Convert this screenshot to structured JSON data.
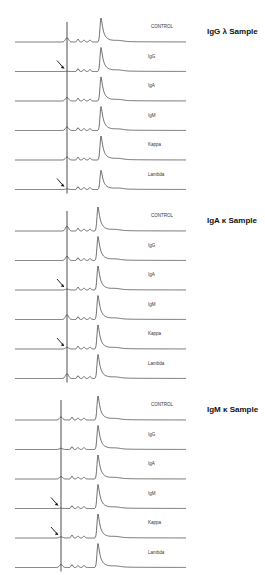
{
  "chart_data": {
    "type": "line",
    "panels": [
      {
        "title": "IgG λ  Sample",
        "arrow_rows": [
          "IgG",
          "Lambda"
        ],
        "traces": [
          {
            "label": "CONTROL",
            "first_peak": 0.35,
            "main_peak": 1.0
          },
          {
            "label": "IgG",
            "first_peak": 0.02,
            "main_peak": 1.0
          },
          {
            "label": "IgA",
            "first_peak": 0.3,
            "main_peak": 1.0
          },
          {
            "label": "IgM",
            "first_peak": 0.3,
            "main_peak": 1.0
          },
          {
            "label": "Kappa",
            "first_peak": 0.25,
            "main_peak": 1.0
          },
          {
            "label": "Lambda",
            "first_peak": 0.05,
            "main_peak": 0.8
          }
        ]
      },
      {
        "title": "IgA κ  Sample",
        "arrow_rows": [
          "IgA",
          "Kappa"
        ],
        "traces": [
          {
            "label": "CONTROL",
            "first_peak": 0.4,
            "main_peak": 1.0
          },
          {
            "label": "IgG",
            "first_peak": 0.35,
            "main_peak": 1.0
          },
          {
            "label": "IgA",
            "first_peak": 0.08,
            "main_peak": 1.0
          },
          {
            "label": "IgM",
            "first_peak": 0.4,
            "main_peak": 1.0
          },
          {
            "label": "Kappa",
            "first_peak": 0.15,
            "main_peak": 1.0
          },
          {
            "label": "Lambda",
            "first_peak": 0.4,
            "main_peak": 1.0
          }
        ]
      },
      {
        "title": "IgM κ  Sample",
        "arrow_rows": [
          "IgM",
          "Kappa"
        ],
        "traces": [
          {
            "label": "CONTROL",
            "first_peak": 0.25,
            "main_peak": 1.0
          },
          {
            "label": "IgG",
            "first_peak": 0.1,
            "main_peak": 1.0
          },
          {
            "label": "IgA",
            "first_peak": 0.2,
            "main_peak": 1.0
          },
          {
            "label": "IgM",
            "first_peak": 0.03,
            "main_peak": 1.0
          },
          {
            "label": "Kappa",
            "first_peak": 0.1,
            "main_peak": 1.0
          },
          {
            "label": "Lambda",
            "first_peak": 0.25,
            "main_peak": 1.0
          }
        ]
      }
    ],
    "xlabel": "",
    "ylabel": "",
    "grid": false,
    "legend": "none"
  }
}
